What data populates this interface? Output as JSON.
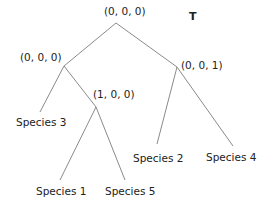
{
  "title": "T",
  "nodes": {
    "root": {
      "label": "(0, 0, 0)"
    },
    "left": {
      "label": "(0, 0, 0)"
    },
    "left_inner": {
      "label": "(1, 0, 0)"
    },
    "right": {
      "label": "(0, 0, 1)"
    }
  },
  "leaves": {
    "species1": "Species 1",
    "species2": "Species 2",
    "species3": "Species 3",
    "species4": "Species 4",
    "species5": "Species 5"
  },
  "colors": {
    "edge": "#8a8a8a",
    "text": "#222222"
  }
}
